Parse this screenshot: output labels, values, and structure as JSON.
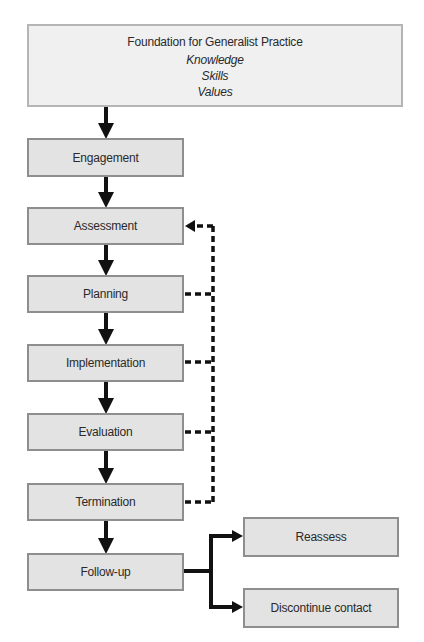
{
  "foundation": {
    "title": "Foundation for Generalist Practice",
    "items": [
      "Knowledge",
      "Skills",
      "Values"
    ]
  },
  "steps": [
    {
      "label": "Engagement"
    },
    {
      "label": "Assessment"
    },
    {
      "label": "Planning"
    },
    {
      "label": "Implementation"
    },
    {
      "label": "Evaluation"
    },
    {
      "label": "Termination"
    },
    {
      "label": "Follow-up"
    }
  ],
  "outcomes": [
    {
      "label": "Reassess"
    },
    {
      "label": "Discontinue contact"
    }
  ],
  "feedback_loop": {
    "target": "Assessment",
    "sources": [
      "Planning",
      "Implementation",
      "Evaluation",
      "Termination"
    ],
    "style": "dashed"
  },
  "colors": {
    "box_fill": "#e3e3e3",
    "box_border": "#8e8e8e",
    "foundation_fill": "#f0f0f0",
    "foundation_border": "#b5b5b5",
    "arrow": "#111111"
  }
}
